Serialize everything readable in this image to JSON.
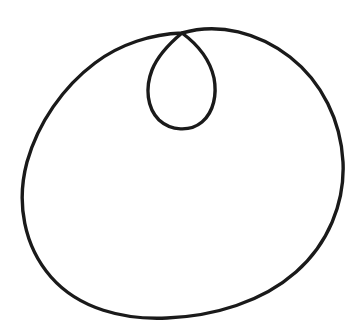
{
  "figure": {
    "kind": "line-drawing",
    "shape_name": "limacon-with-inner-loop",
    "caption": "",
    "background_color": "#ffffff",
    "stroke_color": "#1a1a1a",
    "stroke_width": 3.4,
    "canvas": {
      "width": 364,
      "height": 321
    },
    "node_point": {
      "x": 182,
      "y": 33
    },
    "outer_lobe": {
      "left_x": 23,
      "right_x": 343,
      "top_y": 21,
      "bottom_y": 312,
      "center_x": 183,
      "center_y": 167
    },
    "inner_loop": {
      "left_x": 148,
      "right_x": 215,
      "top_y": 33,
      "bottom_y": 128,
      "center_x": 182,
      "center_y": 81
    },
    "path_d": "M 182 33 C 155 40 126 56 104 78 C 76 106 61 144 58 183 C 55 223 70 262 98 288 C 126 313 164 320 198 316 C 240 311 280 291 305 259 C 330 228 343 188 341 149 C 339 110 325 73 298 48 C 268 21 225 14 190 25 C 182 27 182 30 182 33 Z",
    "path_outer_d": "M 182 33 C 152 34 120 44 95 63 C 63 87 38 123 27 162 C 16 203 24 246 51 277 C 79 309 124 320 167 318 C 214 316 262 302 296 272 C 328 244 345 203 343 162 C 341 121 322 82 290 57 C 259 33 219 22 182 33 Z",
    "path_inner_d": "M 182 33 C 170 43 158 55 152 70 C 145 88 147 108 159 120 C 171 131 190 132 202 122 C 214 112 217 94 214 78 C 210 60 197 44 182 33 Z"
  }
}
